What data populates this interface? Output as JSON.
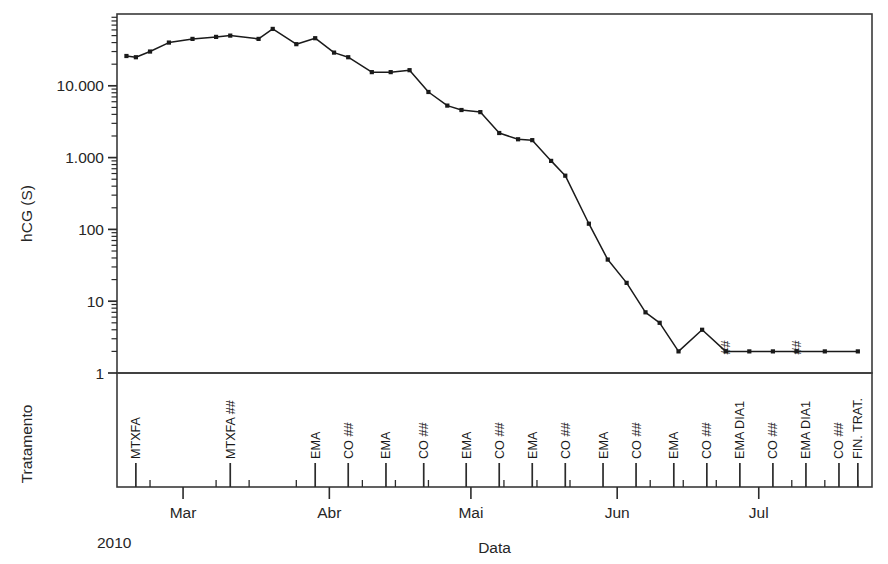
{
  "chart_data": {
    "type": "line",
    "title": "",
    "xlabel": "Data",
    "ylabel": "hCG (S)",
    "y2label": "Tratamento",
    "year_label": "2010",
    "yscale": "log",
    "ylim": [
      1,
      100000
    ],
    "ytick_values": [
      1,
      10,
      100,
      1000,
      10000
    ],
    "ytick_labels": [
      "1",
      "10",
      "100",
      "1.000",
      "10.000"
    ],
    "xlim_days": [
      0,
      160
    ],
    "grid": false,
    "legend": null,
    "month_ticks": [
      {
        "label": "Mar",
        "day": 14
      },
      {
        "label": "Abr",
        "day": 45
      },
      {
        "label": "Mai",
        "day": 75
      },
      {
        "label": "Jun",
        "day": 106
      },
      {
        "label": "Jul",
        "day": 136
      }
    ],
    "minor_tick_days": [
      7,
      21,
      28,
      38,
      52,
      59,
      66,
      82,
      89,
      96,
      113,
      120,
      127,
      143,
      150,
      157
    ],
    "series": [
      {
        "name": "hCG",
        "marker": "dot",
        "color": "#1a1a1a",
        "points": [
          {
            "day": 2,
            "value": 26000
          },
          {
            "day": 4,
            "value": 25000
          },
          {
            "day": 7,
            "value": 30000
          },
          {
            "day": 11,
            "value": 40000
          },
          {
            "day": 16,
            "value": 45000
          },
          {
            "day": 21,
            "value": 48000
          },
          {
            "day": 24,
            "value": 50000
          },
          {
            "day": 30,
            "value": 45000
          },
          {
            "day": 33,
            "value": 62000
          },
          {
            "day": 38,
            "value": 38000
          },
          {
            "day": 42,
            "value": 46000
          },
          {
            "day": 46,
            "value": 29000
          },
          {
            "day": 49,
            "value": 25000
          },
          {
            "day": 54,
            "value": 15500
          },
          {
            "day": 58,
            "value": 15500
          },
          {
            "day": 62,
            "value": 16500
          },
          {
            "day": 66,
            "value": 8200
          },
          {
            "day": 70,
            "value": 5300
          },
          {
            "day": 73,
            "value": 4600
          },
          {
            "day": 77,
            "value": 4300
          },
          {
            "day": 81,
            "value": 2200
          },
          {
            "day": 85,
            "value": 1800
          },
          {
            "day": 88,
            "value": 1750
          },
          {
            "day": 92,
            "value": 900
          },
          {
            "day": 95,
            "value": 560
          },
          {
            "day": 100,
            "value": 120
          },
          {
            "day": 104,
            "value": 38
          },
          {
            "day": 108,
            "value": 18
          },
          {
            "day": 112,
            "value": 7
          },
          {
            "day": 115,
            "value": 5
          },
          {
            "day": 119,
            "value": 2
          },
          {
            "day": 124,
            "value": 4
          },
          {
            "day": 129,
            "value": 2
          },
          {
            "day": 134,
            "value": 2
          },
          {
            "day": 139,
            "value": 2
          },
          {
            "day": 144,
            "value": 2
          },
          {
            "day": 150,
            "value": 2
          },
          {
            "day": 157,
            "value": 2
          }
        ]
      }
    ],
    "point_annotations": [
      {
        "day": 129,
        "text": "##"
      },
      {
        "day": 144,
        "text": "##"
      }
    ],
    "treatments": [
      {
        "day": 4,
        "label": "MTXFA"
      },
      {
        "day": 24,
        "label": "MTXFA ##"
      },
      {
        "day": 42,
        "label": "EMA"
      },
      {
        "day": 49,
        "label": "CO ##"
      },
      {
        "day": 57,
        "label": "EMA"
      },
      {
        "day": 65,
        "label": "CO ##"
      },
      {
        "day": 74,
        "label": "EMA"
      },
      {
        "day": 81,
        "label": "CO ##"
      },
      {
        "day": 88,
        "label": "EMA"
      },
      {
        "day": 95,
        "label": "CO ##"
      },
      {
        "day": 103,
        "label": "EMA"
      },
      {
        "day": 110,
        "label": "CO ##"
      },
      {
        "day": 118,
        "label": "EMA"
      },
      {
        "day": 125,
        "label": "CO ##"
      },
      {
        "day": 132,
        "label": "EMA DIA1"
      },
      {
        "day": 139,
        "label": "CO ##"
      },
      {
        "day": 146,
        "label": "EMA DIA1"
      },
      {
        "day": 153,
        "label": "CO ##"
      },
      {
        "day": 157,
        "label": "FIN. TRAT."
      }
    ]
  }
}
